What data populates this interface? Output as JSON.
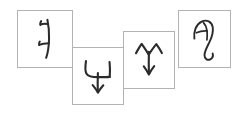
{
  "scene": {
    "title": "Handwritten glyph cards",
    "background_color": "#ffffff",
    "card_border_color": "#b3b3b3",
    "ink_color": "#2b2b2b",
    "card_count": 4
  },
  "cards": [
    {
      "id": "card-1",
      "glyph_name": "branched-vertical-stroke-glyph",
      "description": "Vertical curved stroke with two short side branches ending in ticks",
      "x": 17,
      "y": 10,
      "width": 56,
      "height": 58,
      "z": 1
    },
    {
      "id": "card-2",
      "glyph_name": "trident-down-arrow-glyph",
      "description": "U-shaped fork with central stem ending in a downward arrowhead",
      "x": 72,
      "y": 47,
      "width": 52,
      "height": 58,
      "z": 2
    },
    {
      "id": "card-3",
      "glyph_name": "upward-fork-down-arrow-glyph",
      "description": "Upward two-pronged fork with central stem ending in a downward arrowhead",
      "x": 123,
      "y": 31,
      "width": 52,
      "height": 58,
      "z": 3
    },
    {
      "id": "card-4",
      "glyph_name": "curved-hook-loop-glyph",
      "description": "Rounded loop at top with long descending curved hook tail",
      "x": 178,
      "y": 10,
      "width": 53,
      "height": 58,
      "z": 4
    }
  ]
}
